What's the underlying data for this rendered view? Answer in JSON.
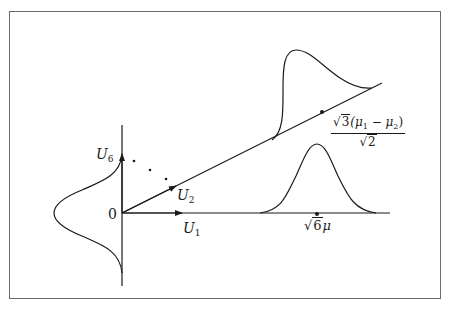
{
  "diagram": {
    "labels": {
      "origin": "0",
      "u1": {
        "base": "U",
        "sub": "1"
      },
      "u2": {
        "base": "U",
        "sub": "2"
      },
      "u6": {
        "base": "U",
        "sub": "6"
      },
      "horizontal_mean": {
        "sqrt": "6",
        "rest": "μ"
      },
      "oblique_mean": {
        "numerator_sqrt": "3",
        "numerator_rest": "(μ",
        "mu1_sub": "1",
        "minus": " − μ",
        "mu2_sub": "2",
        "close": ")",
        "denominator_sqrt": "2"
      }
    },
    "curves": [
      {
        "name": "horizontal-bell",
        "axis": "U1",
        "shape": "symmetric normal",
        "center_label": "√6μ"
      },
      {
        "name": "oblique-skewed-density",
        "axis": "U2 direction",
        "shape": "skewed",
        "center_label": "√3(μ1 − μ2)/√2"
      },
      {
        "name": "vertical-bell",
        "axis": "U6",
        "shape": "symmetric normal centered at 0"
      }
    ],
    "ellipsis_dots": 3,
    "colors": {
      "line": "#1a1a1a",
      "frame": "#6a6a6a",
      "background": "#ffffff"
    }
  }
}
